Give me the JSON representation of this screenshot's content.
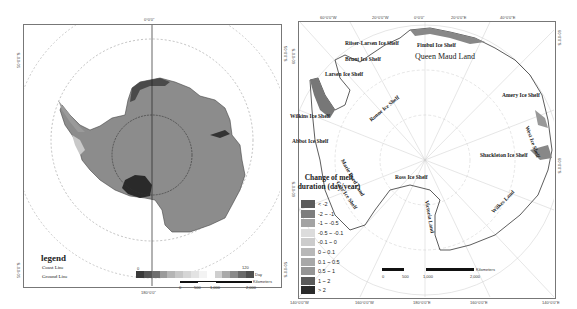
{
  "left_map": {
    "ticks": {
      "top": "0°0'0\"",
      "bottom": "180°0'0\"",
      "left_upper": "50°0'0\"S",
      "left_lower": "50°0'0\"S",
      "right_upper": "50°0'0\"S",
      "right_lower": "50°0'0\"S"
    },
    "legend": {
      "title": "legend",
      "items": [
        "Coast Line",
        "Ground Line"
      ]
    },
    "colorbar": {
      "min_label": "0",
      "max_label": "120",
      "unit": "Day",
      "colors": [
        "#3a3a3a",
        "#555555",
        "#6e6e6e",
        "#9a9a9a",
        "#b5b5b5",
        "#c7c7c7",
        "#d6d6d6",
        "#e3e3e3",
        "#f3f3f3",
        "#ffffff",
        "#cfcfcf",
        "#a9a9a9",
        "#8a8a8a",
        "#6a6a6a",
        "#4f4f4f"
      ]
    },
    "scalebar": {
      "labels": [
        "0",
        "500",
        "1,000",
        "2,000"
      ],
      "unit": "Kilometers"
    }
  },
  "right_map": {
    "ticks": {
      "top": [
        "60°0'0\"W",
        "20°0'0\"W",
        "0°0'0\"",
        "20°0'0\"E",
        "40°0'0\"E"
      ],
      "bottom": [
        "140°0'0\"W",
        "160°0'0\"W",
        "180°0'0\"E",
        "160°0'0\"E",
        "140°0'0\"E"
      ],
      "left": [
        "60°0'0\"S",
        "60°0'0\"S"
      ],
      "right": [
        "60°0'0\"S",
        "60°0'0\"S"
      ]
    },
    "place_labels": [
      {
        "text": "Riiser-Larsen Ice Shelf",
        "x": 55,
        "y": 40
      },
      {
        "text": "Fimbul Ice Shelf",
        "x": 127,
        "y": 42
      },
      {
        "text": "Queen Maud Land",
        "x": 125,
        "y": 52,
        "big": true
      },
      {
        "text": "Brunt Ice Shelf",
        "x": 55,
        "y": 56
      },
      {
        "text": "Larsen Ice Shelf",
        "x": 35,
        "y": 71
      },
      {
        "text": "Amery Ice Shelf",
        "x": 212,
        "y": 92
      },
      {
        "text": "Wilkins Ice Shelf",
        "x": 0,
        "y": 113
      },
      {
        "text": "Abbot Ice Shelf",
        "x": 2,
        "y": 138
      },
      {
        "text": "Shackleton Ice Shelf",
        "x": 190,
        "y": 152
      },
      {
        "text": "Ross Ice Shelf",
        "x": 105,
        "y": 174
      }
    ],
    "rotated_labels": [
      {
        "text": "Ronne Ice Shelf",
        "x": 78,
        "y": 118,
        "angle": -40
      },
      {
        "text": "West Ice Shelf",
        "x": 240,
        "y": 125,
        "angle": 70
      },
      {
        "text": "Marie Byrd Land",
        "x": 55,
        "y": 158,
        "angle": 60
      },
      {
        "text": "Getz Ice Shelf",
        "x": 50,
        "y": 180,
        "angle": 55
      },
      {
        "text": "Victoria Land",
        "x": 140,
        "y": 200,
        "angle": 80
      },
      {
        "text": "Wilkes Land",
        "x": 200,
        "y": 210,
        "angle": -45
      }
    ],
    "melt_legend": {
      "title": "Change of melt duration (day/year)",
      "items": [
        {
          "label": "< -2",
          "color": "#5c5c5c"
        },
        {
          "label": "-2 ~ -1",
          "color": "#7d7d7d"
        },
        {
          "label": "-1 ~ -0.5",
          "color": "#a3a3a3"
        },
        {
          "label": "-0.5 ~ -0.1",
          "color": "#dcdcdc"
        },
        {
          "label": "-0.1 ~ 0",
          "color": "#cccccc"
        },
        {
          "label": "0 ~ 0.1",
          "color": "#b8b8b8"
        },
        {
          "label": "0.1 ~ 0.5",
          "color": "#a8a8a8"
        },
        {
          "label": "0.5 ~ 1",
          "color": "#959595"
        },
        {
          "label": "1 ~ 2",
          "color": "#5a5a5a"
        },
        {
          "label": "> 2",
          "color": "#2a2a2a"
        }
      ]
    },
    "scalebar": {
      "labels": [
        "0",
        "500",
        "1,000",
        "2,000"
      ],
      "unit": "Kilometers"
    }
  }
}
